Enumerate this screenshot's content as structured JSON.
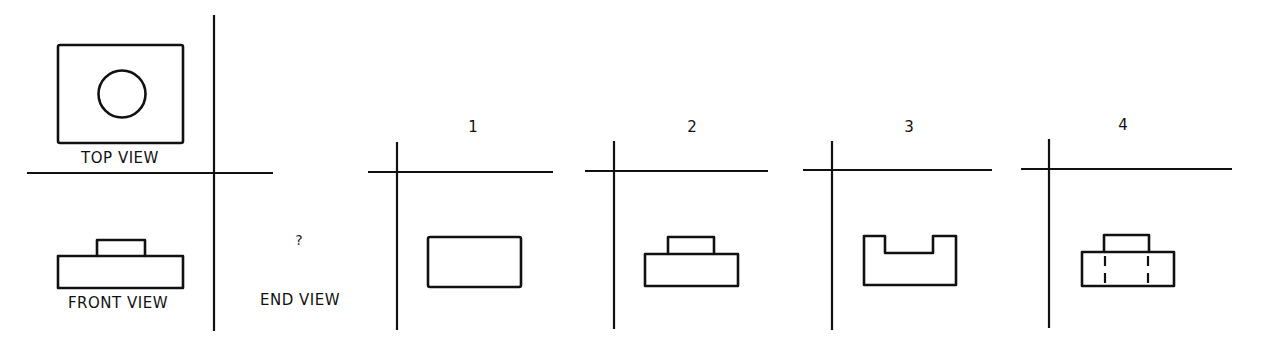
{
  "diagram": {
    "type": "orthographic-projection-quiz",
    "stroke_color": "#111111",
    "background_color": "#ffffff",
    "given_views": {
      "top_view": {
        "label": "TOP VIEW",
        "shape": "rectangle with centered circle"
      },
      "front_view": {
        "label": "FRONT VIEW",
        "shape": "wide rectangle with smaller raised rectangle on top center"
      },
      "end_view": {
        "label": "END VIEW",
        "unknown_marker": "?"
      }
    },
    "options": [
      {
        "number": "1",
        "shape": "plain rectangle"
      },
      {
        "number": "2",
        "shape": "rectangle with raised tab on top"
      },
      {
        "number": "3",
        "shape": "U-shaped channel (notch cut in top)"
      },
      {
        "number": "4",
        "shape": "rectangle with raised tab and two dashed hidden lines"
      }
    ]
  }
}
